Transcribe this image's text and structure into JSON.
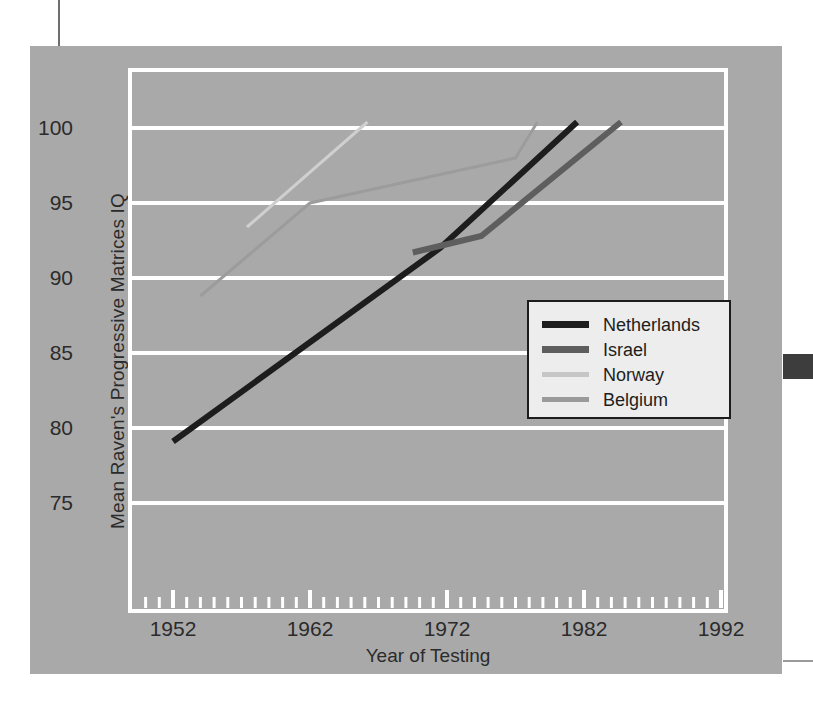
{
  "chart_data": {
    "type": "line",
    "title": "",
    "xlabel": "Year of Testing",
    "ylabel": "Mean Raven's Progressive Matrices IQ",
    "xlim": [
      1947,
      1997
    ],
    "ylim": [
      71.5,
      103.5
    ],
    "xticks": [
      1952,
      1962,
      1972,
      1982,
      1992
    ],
    "xtick_labels": [
      "1952",
      "1962",
      "1972",
      "1982",
      "1992"
    ],
    "yticks": [
      75,
      80,
      85,
      90,
      95,
      100
    ],
    "ytick_labels": [
      "75",
      "80",
      "85",
      "90",
      "95",
      "100"
    ],
    "minor_xtick_interval": 1,
    "grid": "horizontal-major-white",
    "background": "#a9a9a9",
    "gridline_color": "#ffffff",
    "legend_position": "inside-right-middle",
    "series": [
      {
        "name": "Netherlands",
        "color": "#1d1d1d",
        "width": 6,
        "points": [
          [
            1952,
            79.1
          ],
          [
            1971.5,
            92.0
          ],
          [
            1981.5,
            100.4
          ]
        ]
      },
      {
        "name": "Israel",
        "color": "#5e5e5e",
        "width": 6,
        "points": [
          [
            1969.5,
            91.7
          ],
          [
            1974.5,
            92.8
          ],
          [
            1984.7,
            100.4
          ]
        ]
      },
      {
        "name": "Norway",
        "color": "#cfcfcf",
        "width": 3,
        "points": [
          [
            1957.4,
            93.4
          ],
          [
            1966.2,
            100.4
          ]
        ]
      },
      {
        "name": "Belgium",
        "color": "#9c9c9c",
        "width": 3,
        "points": [
          [
            1954.0,
            88.8
          ],
          [
            1962.0,
            95.0
          ],
          [
            1977.0,
            98.0
          ],
          [
            1978.6,
            100.4
          ]
        ]
      }
    ]
  },
  "legend": {
    "items": [
      {
        "label": "Netherlands",
        "color": "#1d1d1d",
        "thickness": 7
      },
      {
        "label": "Israel",
        "color": "#5e5e5e",
        "thickness": 7
      },
      {
        "label": "Norway",
        "color": "#c6c6c6",
        "thickness": 5
      },
      {
        "label": "Belgium",
        "color": "#9a9a9a",
        "thickness": 5
      }
    ]
  },
  "axes": {
    "x_title": "Year of Testing",
    "y_title": "Mean Raven's Progressive Matrices IQ",
    "x_labels": [
      "1952",
      "1962",
      "1972",
      "1982",
      "1992"
    ],
    "y_labels": [
      "100",
      "95",
      "90",
      "85",
      "80",
      "75"
    ]
  },
  "colors": {
    "panel": "#a9a9a9",
    "grid": "#ffffff",
    "frame": "#ffffff",
    "text": "#2b2b2b",
    "legend_bg": "#ededed",
    "legend_border": "#1d1d1d"
  }
}
